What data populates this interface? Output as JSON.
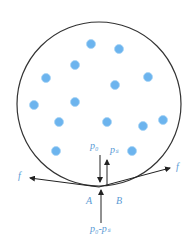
{
  "diagram": {
    "circle": {
      "cx": 99,
      "cy": 104,
      "r": 82,
      "stroke": "#333333"
    },
    "particle_color": "#6cb4ee",
    "particles": [
      [
        91,
        44
      ],
      [
        119,
        49
      ],
      [
        75,
        65
      ],
      [
        46,
        78
      ],
      [
        115,
        85
      ],
      [
        148,
        77
      ],
      [
        34,
        105
      ],
      [
        75,
        102
      ],
      [
        59,
        122
      ],
      [
        107,
        122
      ],
      [
        143,
        126
      ],
      [
        163,
        120
      ],
      [
        56,
        151
      ],
      [
        132,
        151
      ]
    ],
    "label_color": "#5b9bd5",
    "labels": {
      "p0": "p₀",
      "ps": "pₛ",
      "f_left": "f",
      "f_right": "f",
      "A": "A",
      "B": "B",
      "p0_minus_ps": "p₀-pₛ"
    }
  }
}
